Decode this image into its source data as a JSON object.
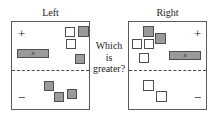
{
  "task": {
    "question_lines": [
      "Which",
      "is",
      "greater?"
    ]
  },
  "panels": [
    {
      "id": "left",
      "title": "Left",
      "positive_sign": "+",
      "negative_sign": "−",
      "bar": {
        "label": "x",
        "fill": "#9a9a9a",
        "region": "positive"
      },
      "items": [
        {
          "fill": "white",
          "region": "positive",
          "x": 53,
          "y": 5,
          "size": 10
        },
        {
          "fill": "gray",
          "region": "positive",
          "x": 66,
          "y": 4,
          "size": 11
        },
        {
          "fill": "white",
          "region": "positive",
          "x": 54,
          "y": 17,
          "size": 10
        },
        {
          "fill": "gray",
          "region": "positive",
          "x": 63,
          "y": 32,
          "size": 10
        },
        {
          "fill": "gray",
          "region": "negative",
          "x": 32,
          "y": 59,
          "size": 10
        },
        {
          "fill": "gray",
          "region": "negative",
          "x": 42,
          "y": 70,
          "size": 10
        },
        {
          "fill": "gray",
          "region": "negative",
          "x": 55,
          "y": 67,
          "size": 10
        }
      ]
    },
    {
      "id": "right",
      "title": "Right",
      "positive_sign": "+",
      "negative_sign": "−",
      "bar": {
        "label": "x",
        "fill": "#9a9a9a",
        "region": "positive"
      },
      "items": [
        {
          "fill": "gray",
          "region": "positive",
          "x": 14,
          "y": 4,
          "size": 11
        },
        {
          "fill": "white",
          "region": "positive",
          "x": 3,
          "y": 17,
          "size": 10
        },
        {
          "fill": "gray",
          "region": "positive",
          "x": 26,
          "y": 11,
          "size": 11
        },
        {
          "fill": "white",
          "region": "positive",
          "x": 15,
          "y": 17,
          "size": 10
        },
        {
          "fill": "white",
          "region": "positive",
          "x": 10,
          "y": 31,
          "size": 10
        },
        {
          "fill": "white",
          "region": "negative",
          "x": 14,
          "y": 58,
          "size": 11
        },
        {
          "fill": "white",
          "region": "negative",
          "x": 27,
          "y": 69,
          "size": 11
        }
      ]
    }
  ],
  "colors": {
    "gray_fill": "#9a9a9a",
    "white_fill": "#ffffff",
    "outline": "#4f4f4f",
    "panel_border": "#5b5b5b",
    "divider": "#4a4a4a",
    "background": "#ffffff",
    "text": "#1c1c1c"
  }
}
